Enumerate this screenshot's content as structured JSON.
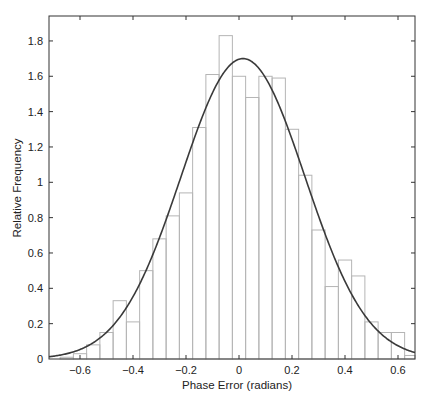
{
  "chart_data": {
    "type": "bar",
    "subtype": "histogram-with-fitted-curve",
    "title": "",
    "xlabel": "Phase Error (radians)",
    "ylabel": "Relative Frequency",
    "xlim": [
      -0.69,
      0.66
    ],
    "ylim": [
      0,
      1.92
    ],
    "xticks": [
      -0.6,
      -0.4,
      -0.2,
      0,
      0.2,
      0.4,
      0.6
    ],
    "xtick_labels": [
      "−0.6",
      "−0.4",
      "−0.2",
      "0",
      "0.2",
      "0.4",
      "0.6"
    ],
    "yticks": [
      0,
      0.2,
      0.4,
      0.6,
      0.8,
      1,
      1.2,
      1.4,
      1.6,
      1.8
    ],
    "ytick_labels": [
      "0",
      "0.2",
      "0.4",
      "0.6",
      "0.8",
      "1",
      "1.2",
      "1.4",
      "1.6",
      "1.8"
    ],
    "grid": false,
    "bin_width": 0.05,
    "bin_centers": [
      -0.65,
      -0.6,
      -0.55,
      -0.5,
      -0.45,
      -0.4,
      -0.35,
      -0.3,
      -0.25,
      -0.2,
      -0.15,
      -0.1,
      -0.05,
      0.0,
      0.05,
      0.1,
      0.15,
      0.2,
      0.25,
      0.3,
      0.35,
      0.4,
      0.45,
      0.5,
      0.55,
      0.6,
      0.65
    ],
    "values": [
      0.01,
      0.03,
      0.08,
      0.15,
      0.33,
      0.21,
      0.5,
      0.68,
      0.81,
      0.94,
      1.31,
      1.61,
      1.83,
      1.6,
      1.48,
      1.6,
      1.59,
      1.3,
      1.04,
      0.73,
      0.41,
      0.56,
      0.47,
      0.21,
      0.15,
      0.15,
      0.02
    ],
    "series": [
      {
        "name": "Histogram",
        "type": "bar",
        "color": "#b5b5b5"
      },
      {
        "name": "Gaussian fit",
        "type": "line",
        "color": "#3a3a3a",
        "mean": 0.015,
        "std": 0.234,
        "peak": 1.7
      }
    ]
  }
}
